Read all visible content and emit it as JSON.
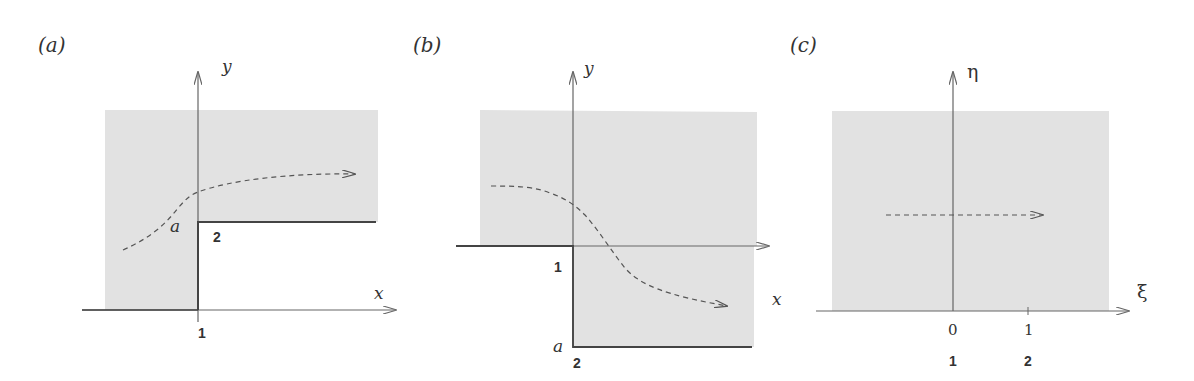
{
  "colors": {
    "shade": "#e2e2e2",
    "axis": "#666666",
    "boundary": "#444444",
    "dashed": "#555555"
  },
  "panels": [
    {
      "label": "(a)",
      "y_axis_label": "y",
      "x_axis_label": "x",
      "point_label": "a",
      "corner_labels": [
        "1",
        "2"
      ]
    },
    {
      "label": "(b)",
      "y_axis_label": "y",
      "x_axis_label": "x",
      "point_label": "a",
      "corner_labels": [
        "1",
        "2"
      ]
    },
    {
      "label": "(c)",
      "y_axis_label": "η",
      "x_axis_label": "ξ",
      "tick_labels": [
        "0",
        "1"
      ],
      "corner_labels": [
        "1",
        "2"
      ]
    }
  ]
}
